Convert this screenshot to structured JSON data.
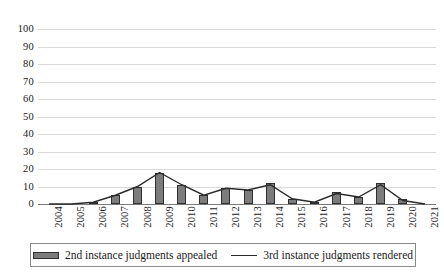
{
  "chart_data": {
    "type": "bar",
    "title": "",
    "subtitle": "",
    "xlabel": "",
    "ylabel": "",
    "ylim": [
      0,
      100
    ],
    "ytick_step": 10,
    "yticks": [
      100,
      90,
      80,
      70,
      60,
      50,
      40,
      30,
      20,
      10,
      0
    ],
    "grid": true,
    "legend_position": "bottom",
    "categories": [
      "2004",
      "2005",
      "2006",
      "2007",
      "2008",
      "2009",
      "2010",
      "2011",
      "2012",
      "2013",
      "2014",
      "2015",
      "2016",
      "2017",
      "2018",
      "2019",
      "2020",
      "2021"
    ],
    "series": [
      {
        "name": "2nd instance judgments appealed",
        "type": "bar",
        "color": "#7c7c7c",
        "values": [
          0,
          0,
          1,
          5,
          10,
          18,
          11,
          5,
          9,
          8,
          12,
          3,
          1,
          7,
          4,
          12,
          3,
          0
        ]
      },
      {
        "name": "3rd instance judgments rendered",
        "type": "line",
        "color": "#2b2b2b",
        "values": [
          0,
          0,
          1,
          5,
          10,
          18,
          11,
          5,
          9,
          8,
          11,
          3,
          1,
          6,
          4,
          11,
          2,
          0
        ]
      }
    ]
  },
  "legend": {
    "items": [
      {
        "label": "2nd instance judgments appealed",
        "marker": "bar-swatch"
      },
      {
        "label": "3rd instance judgments rendered",
        "marker": "line-swatch"
      }
    ]
  }
}
